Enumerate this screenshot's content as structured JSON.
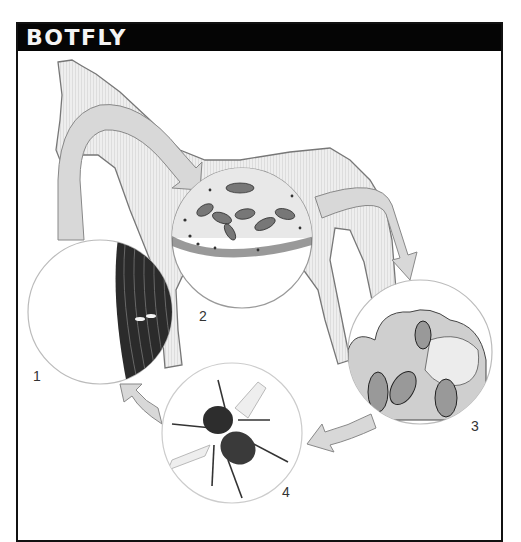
{
  "header": {
    "title": "BOTFLY"
  },
  "diagram": {
    "stages": [
      {
        "number": "1",
        "depiction": "eggs laid on horse hair"
      },
      {
        "number": "2",
        "depiction": "larvae attached to stomach lining"
      },
      {
        "number": "3",
        "depiction": "larvae/pupae in dung on ground"
      },
      {
        "number": "4",
        "depiction": "adult botfly"
      }
    ],
    "colors": {
      "header_bg": "#050505",
      "header_text": "#f4f4f4",
      "arrow_fill": "#d6d6d6",
      "horse_fill": "#e9e9e9",
      "outline": "#777777"
    }
  }
}
